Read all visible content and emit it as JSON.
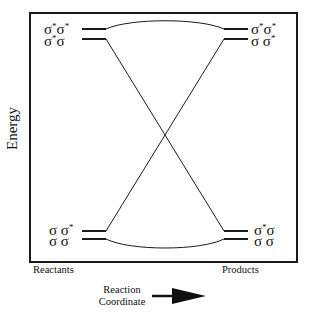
{
  "diagram": {
    "type": "orbital-correlation-diagram",
    "y_axis_label": "Energy",
    "x_axis": {
      "left_label": "Reactants",
      "right_label": "Products",
      "direction_label_line1": "Reaction",
      "direction_label_line2": "Coordinate",
      "direction_arrow": "arrow-right"
    },
    "reactant_levels": [
      {
        "label_base1": "σ",
        "label_sup1": "*",
        "label_base2": "σ",
        "label_sup2": "*",
        "energy_rank": 4,
        "text": "σ*σ*"
      },
      {
        "label_base1": "σ",
        "label_sup1": "*",
        "label_base2": "σ",
        "label_sup2": "",
        "energy_rank": 3,
        "text": "σ*σ"
      },
      {
        "label_base1": "σ",
        "label_sup1": "",
        "label_base2": "σ",
        "label_sup2": "*",
        "energy_rank": 2,
        "text": "σσ*"
      },
      {
        "label_base1": "σ",
        "label_sup1": "",
        "label_base2": "σ",
        "label_sup2": "",
        "energy_rank": 1,
        "text": "σσ"
      }
    ],
    "product_levels": [
      {
        "label_base1": "σ",
        "label_sup1": "*",
        "label_base2": "σ",
        "label_sup2": "*",
        "energy_rank": 4,
        "text": "σ*σ*"
      },
      {
        "label_base1": "σ",
        "label_sup1": "",
        "label_base2": "σ",
        "label_sup2": "*",
        "energy_rank": 3,
        "text": "σσ*"
      },
      {
        "label_base1": "σ",
        "label_sup1": "*",
        "label_base2": "σ",
        "label_sup2": "",
        "energy_rank": 2,
        "text": "σ*σ"
      },
      {
        "label_base1": "σ",
        "label_sup1": "",
        "label_base2": "σ",
        "label_sup2": "",
        "energy_rank": 1,
        "text": "σσ"
      }
    ],
    "correlations": [
      {
        "from": "σ*σ* (reactant)",
        "to": "σ*σ* (product)",
        "shape": "curve-up"
      },
      {
        "from": "σ*σ (reactant)",
        "to": "σ*σ (product)",
        "shape": "crossing-line"
      },
      {
        "from": "σσ* (reactant)",
        "to": "σσ* (product)",
        "shape": "crossing-line"
      },
      {
        "from": "σσ (reactant)",
        "to": "σσ (product)",
        "shape": "curve-down"
      }
    ],
    "colors": {
      "line": "#1a1a1a",
      "background": "#ffffff"
    }
  }
}
